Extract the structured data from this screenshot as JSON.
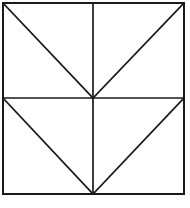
{
  "figure": {
    "name": "chevron-quadrant-square",
    "background_color": "#ffffff",
    "line_color": "#1a1a1a",
    "line_width": 1.7,
    "canvas": {
      "width": 190,
      "height": 208
    },
    "square": {
      "left": 3,
      "top": 3,
      "right": 184,
      "bottom": 194,
      "width": 181,
      "height": 191
    },
    "center_point": {
      "x": 93,
      "y": 98
    },
    "frame_edges": [
      {
        "label": "top-edge",
        "x1": 3,
        "y1": 3,
        "x2": 184,
        "y2": 3
      },
      {
        "label": "right-edge",
        "x1": 184,
        "y1": 3,
        "x2": 184,
        "y2": 194
      },
      {
        "label": "bottom-edge",
        "x1": 184,
        "y1": 194,
        "x2": 3,
        "y2": 194
      },
      {
        "label": "left-edge",
        "x1": 3,
        "y1": 194,
        "x2": 3,
        "y2": 3
      }
    ],
    "midlines": [
      {
        "label": "vertical-midline",
        "x1": 93,
        "y1": 3,
        "x2": 93,
        "y2": 194
      },
      {
        "label": "horizontal-midline",
        "x1": 3,
        "y1": 98,
        "x2": 184,
        "y2": 98
      }
    ],
    "diagonals": [
      {
        "label": "top-left-diagonal",
        "quadrant": "top-left",
        "x1": 3,
        "y1": 3,
        "x2": 93,
        "y2": 98
      },
      {
        "label": "top-right-diagonal",
        "quadrant": "top-right",
        "x1": 93,
        "y1": 98,
        "x2": 184,
        "y2": 3
      },
      {
        "label": "bottom-left-diagonal",
        "quadrant": "bottom-left",
        "x1": 3,
        "y1": 98,
        "x2": 93,
        "y2": 194
      },
      {
        "label": "bottom-right-diagonal",
        "quadrant": "bottom-right",
        "x1": 93,
        "y1": 194,
        "x2": 184,
        "y2": 98
      }
    ],
    "vertices": [
      {
        "label": "top-left-corner",
        "x": 3,
        "y": 3
      },
      {
        "label": "top-center",
        "x": 93,
        "y": 3
      },
      {
        "label": "top-right-corner",
        "x": 184,
        "y": 3
      },
      {
        "label": "middle-left",
        "x": 3,
        "y": 98
      },
      {
        "label": "center",
        "x": 93,
        "y": 98
      },
      {
        "label": "middle-right",
        "x": 184,
        "y": 98
      },
      {
        "label": "bottom-left-corner",
        "x": 3,
        "y": 194
      },
      {
        "label": "bottom-center",
        "x": 93,
        "y": 194
      },
      {
        "label": "bottom-right-corner",
        "x": 184,
        "y": 194
      }
    ]
  }
}
